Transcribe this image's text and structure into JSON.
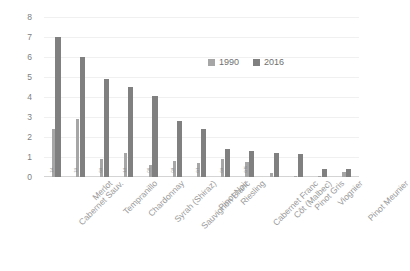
{
  "chart_data": {
    "type": "bar",
    "title": "",
    "subtitle": "",
    "xlabel": "",
    "ylabel": "",
    "ylim": [
      0,
      8
    ],
    "yticks": [
      0,
      1,
      2,
      3,
      4,
      5,
      6,
      7,
      8
    ],
    "grid": true,
    "legend_position": "inside-upper-right",
    "categories": [
      "Cabernet Sauv.",
      "Merlot",
      "Tempranillo",
      "Chardonnay",
      "Syrah (Shiraz)",
      "Sauvignon Blanc",
      "Pinot Noir",
      "Riesling",
      "Cabernet Franc",
      "Côt (Malbec)",
      "Pinot Gris",
      "Viognier",
      "Pinot Meunier"
    ],
    "series": [
      {
        "name": "1990",
        "color": "#a6a6a6",
        "values": [
          2.4,
          2.9,
          0.9,
          1.2,
          0.6,
          0.8,
          0.7,
          0.9,
          0.75,
          0.2,
          0.05,
          0.02,
          0.25
        ],
        "labels": [
          "2.4",
          "2.9",
          "0.9",
          "1.2",
          "0.6",
          "0.8",
          "0.7",
          "0.9",
          "0.75",
          "0.2",
          "0.05",
          "0.02",
          "0.25"
        ]
      },
      {
        "name": "2016",
        "color": "#808080",
        "values": [
          7.0,
          6.0,
          4.9,
          4.5,
          4.05,
          2.8,
          2.4,
          1.4,
          1.3,
          1.2,
          1.15,
          0.4,
          0.4
        ],
        "labels": [
          "7.0",
          "6.0",
          "4.9",
          "4.5",
          "4.05",
          "2.8",
          "2.4",
          "1.4",
          "1.3",
          "1.2",
          "1.15",
          "0.4",
          "0.4"
        ]
      }
    ],
    "legend": [
      {
        "label": "1990",
        "color": "#a6a6a6"
      },
      {
        "label": "2016",
        "color": "#808080"
      }
    ]
  }
}
